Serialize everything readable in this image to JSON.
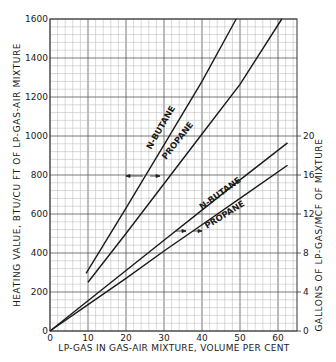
{
  "chart_data": {
    "type": "line",
    "title": "",
    "xlabel": "LP-GAS IN GAS-AIR MIXTURE, VOLUME PER CENT",
    "ylabel": "HEATING VALUE, BTU/CU FT OF LP-GAS-AIR MIXTURE",
    "y2label": "GALLONS OF LP-GAS/MCF OF MIXTURE",
    "xlim": [
      0,
      65
    ],
    "ylim": [
      0,
      1600
    ],
    "y2lim": [
      0,
      32
    ],
    "x_ticks": [
      "0",
      "10",
      "20",
      "30",
      "40",
      "50",
      "60"
    ],
    "x_tick_values": [
      0,
      10,
      20,
      30,
      40,
      50,
      60
    ],
    "y_ticks": [
      "0",
      "200",
      "400",
      "600",
      "800",
      "1000",
      "1200",
      "1400",
      "1600"
    ],
    "y_tick_values": [
      0,
      200,
      400,
      600,
      800,
      1000,
      1200,
      1400,
      1600
    ],
    "y2_ticks": [
      "0",
      "4",
      "8",
      "12",
      "16",
      "20"
    ],
    "y2_tick_values": [
      0,
      4,
      8,
      12,
      16,
      20
    ],
    "grid": true,
    "legend": "none (inline labels)",
    "series": [
      {
        "name": "N-BUTANE",
        "axis": "left",
        "units": "BTU/cu ft",
        "x": [
          9.5,
          20,
          30,
          40,
          49
        ],
        "y": [
          295,
          630,
          955,
          1280,
          1600
        ]
      },
      {
        "name": "PROPANE",
        "axis": "left",
        "units": "BTU/cu ft",
        "x": [
          10,
          20,
          30,
          40,
          50,
          61
        ],
        "y": [
          250,
          500,
          755,
          1010,
          1265,
          1600
        ]
      },
      {
        "name": "N-BUTANE",
        "axis": "right",
        "units": "gal/MCF",
        "x": [
          0,
          10,
          20,
          30,
          40,
          50,
          62.5
        ],
        "y": [
          0,
          3.1,
          6.2,
          9.3,
          12.4,
          15.5,
          19.3
        ]
      },
      {
        "name": "PROPANE",
        "axis": "right",
        "units": "gal/MCF",
        "x": [
          0,
          10,
          20,
          30,
          40,
          50,
          62.5
        ],
        "y": [
          0,
          2.7,
          5.4,
          8.2,
          10.9,
          13.6,
          17.0
        ]
      }
    ],
    "annotations": [
      {
        "text": "N-BUTANE",
        "near": "upper heating-value line"
      },
      {
        "text": "PROPANE",
        "near": "upper heating-value line"
      },
      {
        "text": "N-BUTANE",
        "near": "lower gallons line"
      },
      {
        "text": "PROPANE",
        "near": "lower gallons line"
      },
      {
        "text": "arrows",
        "note": "upper curves read on left axis; lower curves read on right axis"
      }
    ]
  },
  "labels": {
    "xlabel": "LP-GAS IN GAS-AIR MIXTURE, VOLUME PER CENT",
    "ylabel": "HEATING VALUE, BTU/CU FT OF LP-GAS-AIR MIXTURE",
    "y2label": "GALLONS OF LP-GAS/MCF OF MIXTURE",
    "upper_butane": "N-BUTANE",
    "upper_propane": "PROPANE",
    "lower_butane": "N-BUTANE",
    "lower_propane": "PROPANE"
  }
}
